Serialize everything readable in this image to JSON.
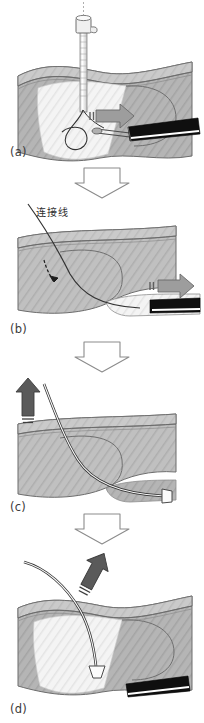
{
  "figure": {
    "type": "surgical-procedure-sequence",
    "panel_count": 4,
    "orientation": "vertical",
    "background_color": "#ffffff",
    "colors": {
      "tissue_light": "#f2f2f2",
      "tissue_mid": "#b9b9b9",
      "tissue_dark": "#9a9a9a",
      "skin_band": "#c9c9c9",
      "outline": "#555555",
      "cannula_black": "#101010",
      "cannula_stripe": "#ffffff",
      "arrow_gray": "#9d9d9d",
      "arrow_dark": "#5a5a5a",
      "connector_outline": "#8c8c8c",
      "suture_line": "#3a3a3a",
      "text": "#2e2e2e"
    }
  },
  "panels": [
    {
      "id": "panel-a",
      "label": "(a)",
      "caption_text": "(a)",
      "elements": {
        "needle": "trocar-needle-with-hub",
        "cannula": "black-arthroscope-cannula",
        "arrow": "gray-block-arrow-right",
        "suture": "suture-loop"
      }
    },
    {
      "id": "panel-b",
      "label": "(b)",
      "caption_text": "(b)",
      "annotation": "连接线",
      "elements": {
        "cannula": "black-arthroscope-cannula",
        "arrow": "gray-block-arrow-right",
        "suture": "suture-strand-pulled",
        "inner_arrow": "thin-black-direction-arrow"
      }
    },
    {
      "id": "panel-c",
      "label": "(c)",
      "caption_text": "(c)",
      "elements": {
        "arrow": "dark-gray-arrow-up",
        "suture": "suture-strand-through-tunnel",
        "anchor_tip": "white-trapezoid-anchor-tip"
      }
    },
    {
      "id": "panel-d",
      "label": "(d)",
      "caption_text": "(d)",
      "elements": {
        "cannula": "black-arthroscope-cannula",
        "arrow": "dark-gray-arrow-up-right",
        "suture": "suture-strand-exiting",
        "anchor_tip": "white-trapezoid-anchor-tip"
      }
    }
  ],
  "connectors": [
    {
      "id": "connector-ab",
      "icon": "hollow-down-arrow"
    },
    {
      "id": "connector-bc",
      "icon": "hollow-down-arrow"
    },
    {
      "id": "connector-cd",
      "icon": "hollow-down-arrow"
    }
  ],
  "labels": {
    "a": "(a)",
    "b": "(b)",
    "c": "(c)",
    "d": "(d)",
    "connecting_line": "连接线"
  }
}
